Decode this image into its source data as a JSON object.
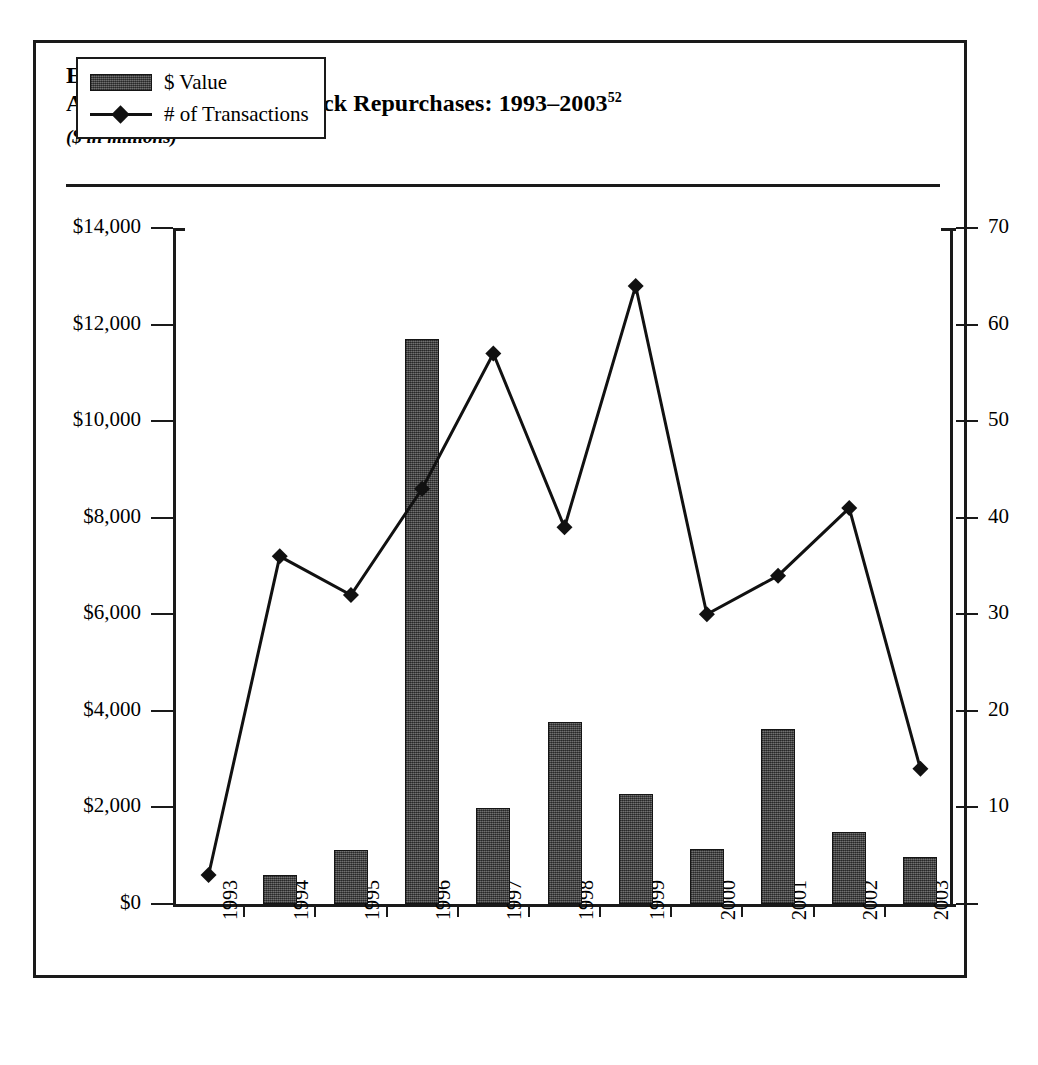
{
  "exhibit": {
    "number": "Exhibit 19-22",
    "title": "Announced Targeted Block Repurchases: 1993–2003",
    "title_superscript": "52",
    "subtitle": "($ in millions)"
  },
  "legend": {
    "bar_label": "$ Value",
    "line_label": "# of Transactions"
  },
  "axes": {
    "left_ticks": [
      "$0",
      "$2,000",
      "$4,000",
      "$6,000",
      "$8,000",
      "$10,000",
      "$12,000",
      "$14,000"
    ],
    "right_ticks": [
      "10",
      "20",
      "30",
      "40",
      "50",
      "60",
      "70"
    ],
    "x_ticks": [
      "1993",
      "1994",
      "1995",
      "1996",
      "1997",
      "1998",
      "1999",
      "2000",
      "2001",
      "2002",
      "2003"
    ]
  },
  "colors": {
    "bar_fill": "#4a4a4a",
    "line": "#111111",
    "frame": "#1a1a1a",
    "background": "#ffffff"
  },
  "chart_data": {
    "type": "bar",
    "title": "Announced Targeted Block Repurchases: 1993–2003",
    "subtitle": "($ in millions)",
    "xlabel": "",
    "ylabel": "",
    "y2label": "",
    "grid": false,
    "legend_position": "top-left-inside",
    "categories": [
      "1993",
      "1994",
      "1995",
      "1996",
      "1997",
      "1998",
      "1999",
      "2000",
      "2001",
      "2002",
      "2003"
    ],
    "series": [
      {
        "name": "$ Value",
        "type": "bar",
        "axis": "left",
        "unit": "$ millions",
        "values": [
          30,
          600,
          1110,
          11700,
          1990,
          3760,
          2270,
          1130,
          3620,
          1500,
          970
        ]
      },
      {
        "name": "# of Transactions",
        "type": "line",
        "axis": "right",
        "unit": "count",
        "marker": "diamond",
        "values": [
          3,
          36,
          32,
          43,
          57,
          39,
          64,
          30,
          34,
          41,
          14
        ]
      }
    ],
    "ylim": [
      0,
      14000
    ],
    "y2lim": [
      0,
      70
    ],
    "ytick_values": [
      0,
      2000,
      4000,
      6000,
      8000,
      10000,
      12000,
      14000
    ],
    "y2tick_values": [
      0,
      10,
      20,
      30,
      40,
      50,
      60,
      70
    ]
  }
}
